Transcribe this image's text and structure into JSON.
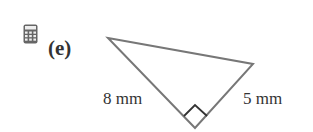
{
  "problem": {
    "label": "(e)",
    "icon": "calculator-icon",
    "figure": {
      "shape": "right-triangle",
      "right_angle_marker": true,
      "sides": [
        {
          "position": "left",
          "label": "8 mm"
        },
        {
          "position": "right",
          "label": "5 mm"
        }
      ],
      "stroke_color": "#777777"
    }
  }
}
